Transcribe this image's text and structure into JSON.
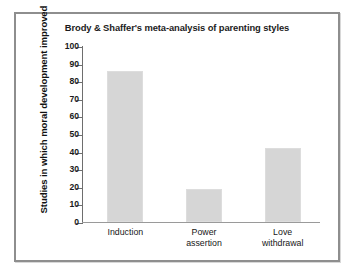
{
  "figure": {
    "frame_color": "#8e8e8e",
    "background": "#ffffff"
  },
  "chart_data": {
    "type": "bar",
    "title": "Brody & Shaffer's meta-analysis of parenting styles",
    "xlabel": "",
    "ylabel": "Studies in which moral development improved",
    "categories": [
      "Induction",
      "Power\nassertion",
      "Love\nwithdrawal"
    ],
    "values": [
      86,
      19,
      42
    ],
    "ylim": [
      0,
      100
    ],
    "yticks": [
      0,
      10,
      20,
      30,
      40,
      50,
      60,
      70,
      80,
      90,
      100
    ],
    "ytick_labels": [
      "0",
      "10",
      "20",
      "30",
      "40",
      "50",
      "60",
      "70",
      "80",
      "90",
      "100"
    ],
    "grid": false,
    "legend": null,
    "bar_color": "#d6d6d6"
  }
}
